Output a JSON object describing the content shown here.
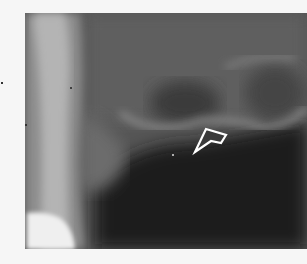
{
  "image": {
    "type": "dental-radiograph",
    "description": "Grayscale X-ray showing tooth root on left, bone with radiolucent area, and outlined white arrow pointing to a lesion",
    "annotation": {
      "shape": "hollow-arrow",
      "color": "#ffffff",
      "direction": "down-left"
    },
    "colors": {
      "background": "#f6f6f6",
      "film_dark": "#1c1c1c",
      "film_mid": "#4a4a4a",
      "bone_light": "#9a9a9a",
      "tooth": "#c8c8c8",
      "restoration": "#f0f0f0"
    }
  }
}
